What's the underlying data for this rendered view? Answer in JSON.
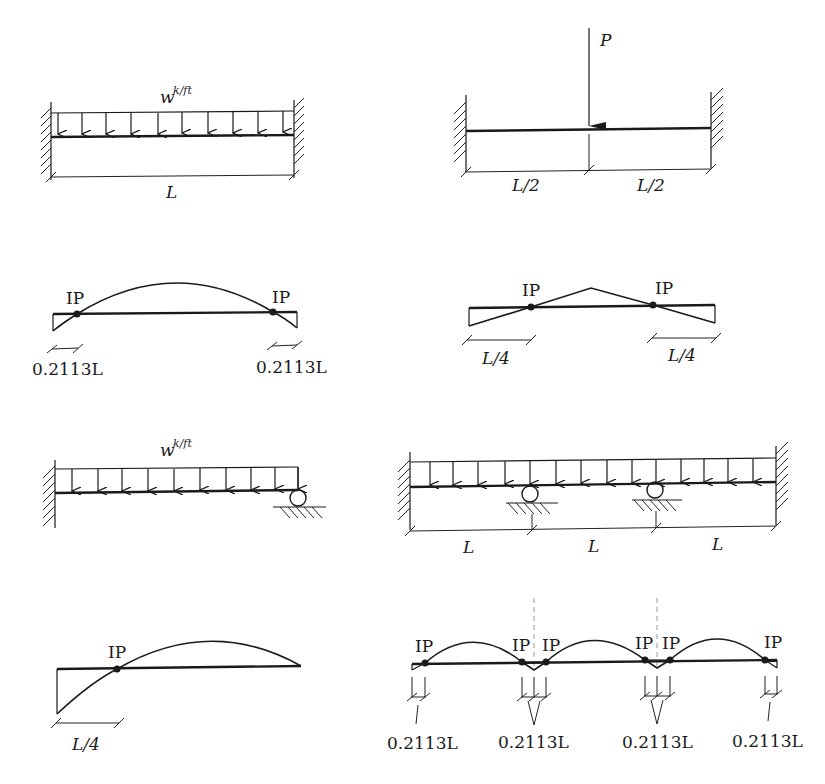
{
  "diagrams": {
    "fixed_fixed_udl": {
      "load_label": "w",
      "load_unit": "k/ft",
      "span_label": "L"
    },
    "fixed_fixed_point": {
      "load_label": "P",
      "left_span_label": "L/2",
      "right_span_label": "L/2"
    },
    "fixed_fixed_udl_moment": {
      "left_ip_label": "IP",
      "right_ip_label": "IP",
      "left_dim_label": "0.2113L",
      "right_dim_label": "0.2113L"
    },
    "fixed_fixed_point_moment": {
      "left_ip_label": "IP",
      "right_ip_label": "IP",
      "left_dim_label": "L/4",
      "right_dim_label": "L/4"
    },
    "propped_cantilever_udl": {
      "load_label": "w",
      "load_unit": "k/ft"
    },
    "three_span_udl": {
      "span_labels": [
        "L",
        "L",
        "L"
      ]
    },
    "propped_cantilever_moment": {
      "ip_label": "IP",
      "dim_label": "L/4"
    },
    "three_span_moment": {
      "ip_labels": [
        "IP",
        "IP",
        "IP",
        "IP",
        "IP",
        "IP"
      ],
      "dim_labels": [
        "0.2113L",
        "0.2113L",
        "0.2113L",
        "0.2113L"
      ]
    }
  }
}
